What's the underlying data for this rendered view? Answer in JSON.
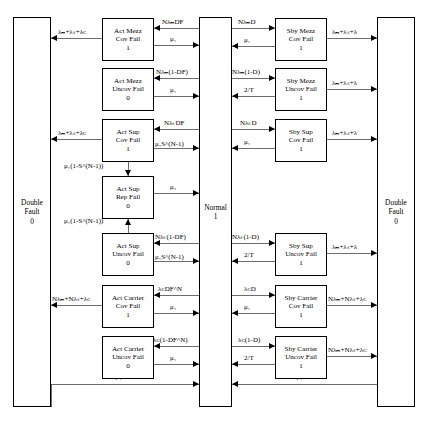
{
  "diagram": {
    "left_state": {
      "line1": "Double",
      "line2": "Fault",
      "line3": "0"
    },
    "center_state": {
      "line1": "Normal",
      "line2": "1"
    },
    "right_state": {
      "line1": "Double",
      "line2": "Fault",
      "line3": "0"
    },
    "active_states": [
      {
        "line1": "Act Mezz",
        "line2": "Cov Fail",
        "line3": "1"
      },
      {
        "line1": "Act Mezz",
        "line2": "Uncov Fail",
        "line3": "0"
      },
      {
        "line1": "Act Sup",
        "line2": "Cov Fail",
        "line3": "1"
      },
      {
        "line1": "Act Sup",
        "line2": "Rep Fail",
        "line3": "0"
      },
      {
        "line1": "Act Sup",
        "line2": "Uncov Fail",
        "line3": "0"
      },
      {
        "line1": "Act Carrier",
        "line2": "Cov Fail",
        "line3": "1"
      },
      {
        "line1": "Act Carrier",
        "line2": "Uncov Fail",
        "line3": "0"
      }
    ],
    "standby_states": [
      {
        "line1": "Sby Mezz",
        "line2": "Cov Fail",
        "line3": "1"
      },
      {
        "line1": "Sby Mezz",
        "line2": "Uncov Fail",
        "line3": "1"
      },
      {
        "line1": "Sby Sup",
        "line2": "Cov Fail",
        "line3": "1"
      },
      {
        "line1": "Sby Sup",
        "line2": "Uncov Fail",
        "line3": "1"
      },
      {
        "line1": "Sby Carrier",
        "line2": "Cov Fail",
        "line3": "1"
      },
      {
        "line1": "Sby Carrier",
        "line2": "Uncov Fail",
        "line3": "1"
      }
    ],
    "labels": {
      "act_mezz_cov_in": "NλₘDF",
      "act_mezz_cov_out": "μ₁",
      "act_mezz_cov_toDF": "λₘ+λₛ+λᴄ",
      "act_mezz_uncov_in": "Nλₘ(1-DF)",
      "act_mezz_uncov_out": "μ₁",
      "act_sup_cov_in": "NλₛDF",
      "act_sup_cov_out": "μ₁S^(N-1)",
      "act_sup_cov_toDF": "λₘ+λₛ+λᴄ",
      "act_sup_cov_down": "μ₁(1-S^(N-1))",
      "act_sup_rep_out": "μ₂",
      "act_sup_uncov_up": "μ₁(1-S^(N-1))",
      "act_sup_uncov_in": "Nλₛ(1-DF)",
      "act_sup_uncov_out": "μ₁S^(N-1)",
      "act_carrier_cov_in": "λᴄDF^N",
      "act_carrier_cov_out": "μ₁",
      "act_carrier_cov_toDF": "Nλₘ+Nλₛ+λᴄ",
      "act_carrier_uncov_in": "λᴄ(1-DF^N)",
      "act_carrier_uncov_out": "μ₁",
      "bottom_left": "2μ₁",
      "sby_mezz_cov_in": "NλₘD",
      "sby_mezz_cov_out": "μ₁",
      "sby_mezz_cov_toDF": "λₘ+λₛ+λ",
      "sby_mezz_uncov_in": "Nλₘ(1-D)",
      "sby_mezz_uncov_out": "2/T",
      "sby_mezz_uncov_toDF": "λₘ+λₛ+λ",
      "sby_sup_cov_in": "NλₛD",
      "sby_sup_cov_out": "μ₁",
      "sby_sup_cov_toDF": "λₘ+λₛ+λ",
      "sby_sup_uncov_in": "Nλₛ(1-D)",
      "sby_sup_uncov_out": "2/T",
      "sby_sup_uncov_toDF": "λₘ+λₛ+λ",
      "sby_carrier_cov_in": "λᴄD",
      "sby_carrier_cov_out": "μ₁",
      "sby_carrier_cov_toDF": "Nλₘ+Nλₛ+λᴄ",
      "sby_carrier_uncov_in": "λᴄ(1-D)",
      "sby_carrier_uncov_out": "2/T",
      "sby_carrier_uncov_toDF": "Nλₘ+Nλₛ+λᴄ",
      "bottom_right": "2μ₁"
    }
  }
}
